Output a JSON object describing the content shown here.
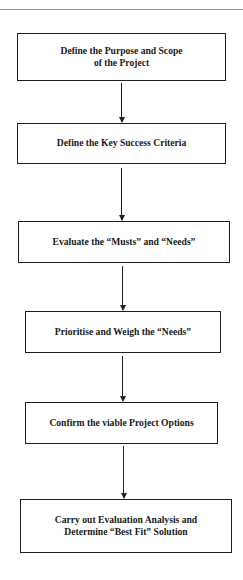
{
  "diagram": {
    "type": "flowchart",
    "direction": "top-to-bottom",
    "steps": [
      {
        "id": 1,
        "label": "Define the Purpose and Scope of the Project",
        "lines": [
          "Define the Purpose and Scope",
          "of the Project"
        ]
      },
      {
        "id": 2,
        "label": "Define the Key Success Criteria",
        "lines": [
          "Define the Key Success Criteria"
        ]
      },
      {
        "id": 3,
        "label": "Evaluate the “Musts” and “Needs”",
        "lines": [
          "Evaluate the “Musts” and “Needs”"
        ]
      },
      {
        "id": 4,
        "label": "Prioritise and Weigh the “Needs”",
        "lines": [
          "Prioritise and Weigh the “Needs”"
        ]
      },
      {
        "id": 5,
        "label": "Confirm the viable Project Options",
        "lines": [
          "Confirm the viable Project Options"
        ]
      },
      {
        "id": 6,
        "label": "Carry out Evaluation Analysis and Determine “Best Fit” Solution",
        "lines": [
          "Carry out Evaluation Analysis and",
          "Determine “Best Fit” Solution"
        ]
      }
    ],
    "edges": [
      {
        "from": 1,
        "to": 2
      },
      {
        "from": 2,
        "to": 3
      },
      {
        "from": 3,
        "to": 4
      },
      {
        "from": 4,
        "to": 5
      },
      {
        "from": 5,
        "to": 6
      }
    ],
    "colors": {
      "border": "#1e1e1e",
      "text": "#1a1a1a",
      "background": "#ffffff",
      "top_rule": "#9a9a9a"
    }
  }
}
